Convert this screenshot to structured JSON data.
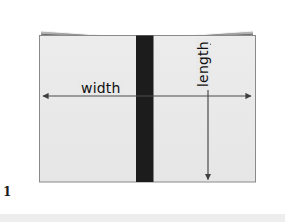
{
  "figure": {
    "number": "1",
    "caption_label": "1",
    "background_color": "#ffffff",
    "labels": {
      "width": "width",
      "length": "length"
    },
    "colors": {
      "cover": "#e9e9e9",
      "cover_border": "#8a8a8a",
      "spine": "#1c1c1c",
      "pages_light": "#f2f2f2",
      "pages_dark": "#6e6e6e",
      "arrow": "#4a4a4a",
      "text": "#111111",
      "bottom_band": "#ededed"
    },
    "geometry": {
      "cover_left": 39,
      "cover_right": 256,
      "cover_top": 35,
      "cover_bottom": 182,
      "spine_left": 136,
      "spine_right": 153,
      "pages_apex_x": 147,
      "pages_top_y": 29,
      "width_arrow_y": 96,
      "width_arrow_x1": 41,
      "width_arrow_x2": 253,
      "length_arrow_x": 208,
      "length_arrow_y1": 37,
      "length_arrow_y2": 181
    }
  },
  "diagram_data": {
    "type": "annotated-illustration",
    "subject": "open-book-top-view",
    "title": "",
    "annotations": [
      {
        "name": "width",
        "label": "width",
        "orientation": "horizontal",
        "arrow": "double-headed",
        "spans": "left cover edge to right cover edge"
      },
      {
        "name": "length",
        "label": "length",
        "orientation": "vertical",
        "arrow": "double-headed",
        "spans": "top cover edge to bottom cover edge",
        "text_rotation_deg": -90
      }
    ],
    "parts": [
      {
        "name": "front-cover-left",
        "fill": "#e9e9e9"
      },
      {
        "name": "front-cover-right",
        "fill": "#e9e9e9"
      },
      {
        "name": "spine",
        "fill": "#1c1c1c"
      },
      {
        "name": "page-block",
        "fill": "#f2f2f2"
      }
    ]
  }
}
